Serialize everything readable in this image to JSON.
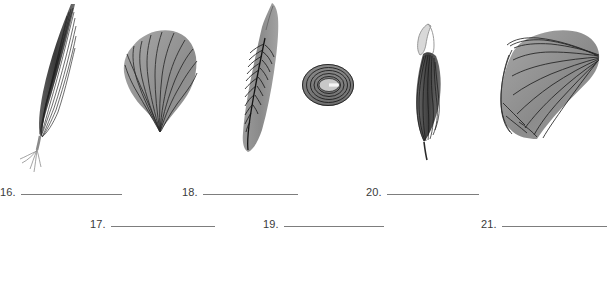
{
  "page": {
    "background_color": "#ffffff",
    "width": 607,
    "height": 281
  },
  "plate": {
    "name": "specimen-identification-plate",
    "description": "Six grayscale biological specimen illustrations arranged in a horizontal row",
    "ink_color": "#262626",
    "fill_light": "#b0b0b0",
    "fill_mid": "#8f8f8f",
    "fill_dark": "#6e6e6e",
    "specimens": [
      {
        "index": 1,
        "name": "elongated-striated-specimen-with-rootlets",
        "shape": "narrow lanceolate blade with fine splayed rootlets at base",
        "vein_pattern": "parallel longitudinal striations",
        "tone": "dark"
      },
      {
        "index": 2,
        "name": "fan-shaped-ribbed-specimen",
        "shape": "broad rounded fan tapering to a basal point",
        "vein_pattern": "radiating ribs converging at base",
        "tone": "medium"
      },
      {
        "index": 3,
        "name": "pinnate-veined-leaf-specimen",
        "shape": "narrow elongated leaf with pointed tip",
        "vein_pattern": "pinnate, midrib with angled lateral veins",
        "tone": "medium"
      },
      {
        "index": 4,
        "name": "concentric-oval-ring-specimen",
        "shape": "small oval annulus with concentric rings",
        "vein_pattern": "concentric growth rings",
        "tone": "medium-dark"
      },
      {
        "index": 5,
        "name": "looped-stalk-striated-specimen",
        "shape": "slender elongated blade with open loop at apex and tapering tail",
        "vein_pattern": "parallel longitudinal striations",
        "tone": "dark"
      },
      {
        "index": 6,
        "name": "broad-shell-fan-specimen",
        "shape": "wide shell-like fan with hinge point at upper right",
        "vein_pattern": "curved radiating ribs from hinge",
        "tone": "medium"
      }
    ]
  },
  "answers": {
    "title": "numbered-answer-blanks",
    "items": [
      {
        "number": "16.",
        "value": ""
      },
      {
        "number": "17.",
        "value": ""
      },
      {
        "number": "18.",
        "value": ""
      },
      {
        "number": "19.",
        "value": ""
      },
      {
        "number": "20.",
        "value": ""
      },
      {
        "number": "21.",
        "value": ""
      }
    ]
  }
}
